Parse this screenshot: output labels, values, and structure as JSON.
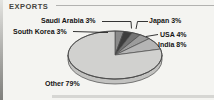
{
  "header": {
    "title": "EXPORTS"
  },
  "chart_data": {
    "type": "pie",
    "title": "EXPORTS",
    "categories": [
      "South Korea",
      "Saudi Arabia",
      "Japan",
      "USA",
      "India",
      "Other"
    ],
    "values": [
      3,
      3,
      3,
      4,
      8,
      79
    ],
    "unit": "%",
    "direction": "clockwise",
    "start_angle": "12-oclock",
    "style": "3d-ellipse",
    "slice_colors": [
      "#8a8a8a",
      "#3d3d3d",
      "#757575",
      "#9c9c9c",
      "#b5b5b5",
      "#d1d1cf"
    ],
    "side_color": "#c2c2c0",
    "outline_color": "#4a4a4a",
    "leader_line_color": "#1f1f1f",
    "background_color": "#f4f4f1"
  }
}
